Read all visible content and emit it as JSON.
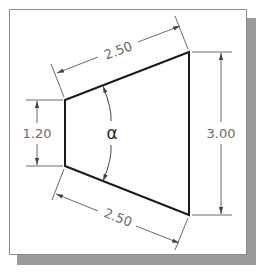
{
  "figure": {
    "type": "dimensioned technical drawing",
    "shape": "trapezoid",
    "colors": {
      "outline": "#1a1a1a",
      "dimension": "#6a6a6a",
      "shadow": "#9a9a9a",
      "background": "#ffffff"
    }
  },
  "dimensions": {
    "top_edge": "2.50",
    "bottom_edge": "2.50",
    "left_height": "1.20",
    "right_height": "3.00",
    "angle_label": "α"
  }
}
